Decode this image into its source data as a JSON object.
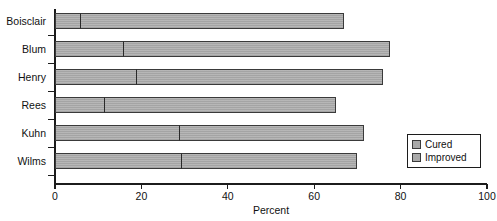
{
  "chart_data": {
    "type": "bar",
    "orientation": "horizontal",
    "stacked": true,
    "title": "",
    "xlabel": "Percent",
    "ylabel": "",
    "xlim": [
      0,
      100
    ],
    "xticks": [
      0,
      20,
      40,
      60,
      80,
      100
    ],
    "xtick_labels": [
      "0",
      "20",
      "40",
      "60",
      "80",
      "100"
    ],
    "grid": false,
    "legend_position": "bottom-right",
    "categories": [
      "Boisclair",
      "Blum",
      "Henry",
      "Rees",
      "Kuhn",
      "Wilms"
    ],
    "series": [
      {
        "name": "Cured",
        "color": "#a9a9a9",
        "values": [
          6,
          16,
          19,
          11.5,
          29,
          29.5
        ]
      },
      {
        "name": "Improved",
        "color": "#a9a9a9",
        "values": [
          61,
          61.5,
          57,
          53.5,
          42.5,
          40.5
        ]
      }
    ],
    "totals": [
      67,
      77.5,
      76,
      65,
      71.5,
      70
    ]
  },
  "legend": {
    "items": [
      {
        "label": "Cured",
        "swatch": "legend-swatch-cured"
      },
      {
        "label": "Improved",
        "swatch": "legend-swatch-improved"
      }
    ]
  }
}
